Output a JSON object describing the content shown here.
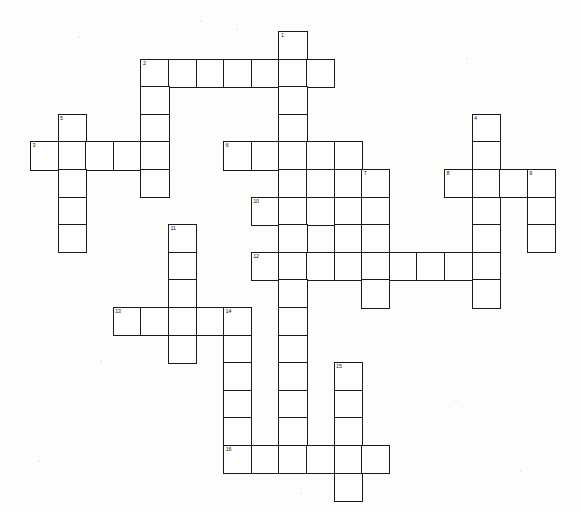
{
  "document": {
    "type": "crossword-puzzle-grid",
    "title": "Crossword Puzzle",
    "background_color": "#fdfdfc",
    "cell_fill_color": "#ffffff",
    "cell_border_color": "#1a1a1a",
    "number_color": "#151515",
    "cell_size_px": 27.6,
    "origin": {
      "x": 30,
      "y": 31
    },
    "grid_columns": 19,
    "grid_rows": 17
  },
  "chart_data": {
    "type": "table",
    "clue_numbers": [
      1,
      2,
      3,
      4,
      5,
      6,
      7,
      8,
      9,
      10,
      11,
      12,
      13,
      14,
      15,
      16
    ],
    "entries": [
      {
        "number": 1,
        "direction": "down",
        "col": 9,
        "row": 0,
        "length": 5
      },
      {
        "number": 2,
        "direction": "across",
        "col": 4,
        "row": 1,
        "length": 7
      },
      {
        "number": 3,
        "direction": "across",
        "col": 0,
        "row": 4,
        "length": 5
      },
      {
        "number": 4,
        "direction": "down",
        "col": 16,
        "row": 3,
        "length": 7
      },
      {
        "number": 5,
        "direction": "down",
        "col": 1,
        "row": 3,
        "length": 6
      },
      {
        "number": 6,
        "direction": "across",
        "col": 7,
        "row": 4,
        "length": 5
      },
      {
        "number": 7,
        "direction": "down",
        "col": 12,
        "row": 5,
        "length": 5
      },
      {
        "number": 8,
        "direction": "across",
        "col": 15,
        "row": 5,
        "length": 4
      },
      {
        "number": 9,
        "direction": "down",
        "col": 18,
        "row": 5,
        "length": 4
      },
      {
        "number": 10,
        "direction": "across",
        "col": 8,
        "row": 6,
        "length": 5
      },
      {
        "number": 11,
        "direction": "down",
        "col": 5,
        "row": 7,
        "length": 5
      },
      {
        "number": 12,
        "direction": "across",
        "col": 8,
        "row": 8,
        "length": 9
      },
      {
        "number": 13,
        "direction": "across",
        "col": 3,
        "row": 10,
        "length": 5
      },
      {
        "number": 14,
        "direction": "down",
        "col": 7,
        "row": 10,
        "length": 6
      },
      {
        "number": 15,
        "direction": "down",
        "col": 11,
        "row": 12,
        "length": 5
      },
      {
        "number": 16,
        "direction": "across",
        "col": 7,
        "row": 15,
        "length": 6
      }
    ],
    "down_columns": [
      {
        "label": "1",
        "col": 9,
        "row_start": 0,
        "row_end": 4
      },
      {
        "label": "2",
        "col": 4,
        "row_start": 1,
        "row_end": 5
      },
      {
        "label": "4",
        "col": 16,
        "row_start": 3,
        "row_end": 9
      },
      {
        "label": "5",
        "col": 1,
        "row_start": 3,
        "row_end": 8
      },
      {
        "label": "7",
        "col": 12,
        "row_start": 5,
        "row_end": 9
      },
      {
        "label": "9",
        "col": 18,
        "row_start": 5,
        "row_end": 8
      },
      {
        "label": "11",
        "col": 5,
        "row_start": 7,
        "row_end": 11
      },
      {
        "label": "14",
        "col": 7,
        "row_start": 10,
        "row_end": 15
      },
      {
        "label": "15",
        "col": 11,
        "row_start": 12,
        "row_end": 16
      },
      {
        "label": "center",
        "col": 9,
        "row_start": 4,
        "row_end": 15
      }
    ],
    "cells": [
      {
        "col": 9,
        "row": 0,
        "num": "1"
      },
      {
        "col": 4,
        "row": 1,
        "num": "2"
      },
      {
        "col": 5,
        "row": 1,
        "num": ""
      },
      {
        "col": 6,
        "row": 1,
        "num": ""
      },
      {
        "col": 7,
        "row": 1,
        "num": ""
      },
      {
        "col": 8,
        "row": 1,
        "num": ""
      },
      {
        "col": 9,
        "row": 1,
        "num": ""
      },
      {
        "col": 10,
        "row": 1,
        "num": ""
      },
      {
        "col": 4,
        "row": 2,
        "num": ""
      },
      {
        "col": 9,
        "row": 2,
        "num": ""
      },
      {
        "col": 1,
        "row": 3,
        "num": "5"
      },
      {
        "col": 4,
        "row": 3,
        "num": ""
      },
      {
        "col": 9,
        "row": 3,
        "num": ""
      },
      {
        "col": 16,
        "row": 3,
        "num": "4"
      },
      {
        "col": 0,
        "row": 4,
        "num": "3"
      },
      {
        "col": 1,
        "row": 4,
        "num": ""
      },
      {
        "col": 2,
        "row": 4,
        "num": ""
      },
      {
        "col": 3,
        "row": 4,
        "num": ""
      },
      {
        "col": 4,
        "row": 4,
        "num": ""
      },
      {
        "col": 7,
        "row": 4,
        "num": "6"
      },
      {
        "col": 8,
        "row": 4,
        "num": ""
      },
      {
        "col": 9,
        "row": 4,
        "num": ""
      },
      {
        "col": 10,
        "row": 4,
        "num": ""
      },
      {
        "col": 11,
        "row": 4,
        "num": ""
      },
      {
        "col": 16,
        "row": 4,
        "num": ""
      },
      {
        "col": 1,
        "row": 5,
        "num": ""
      },
      {
        "col": 4,
        "row": 5,
        "num": ""
      },
      {
        "col": 9,
        "row": 5,
        "num": ""
      },
      {
        "col": 10,
        "row": 5,
        "num": ""
      },
      {
        "col": 11,
        "row": 5,
        "num": ""
      },
      {
        "col": 12,
        "row": 5,
        "num": "7"
      },
      {
        "col": 15,
        "row": 5,
        "num": "8"
      },
      {
        "col": 16,
        "row": 5,
        "num": ""
      },
      {
        "col": 17,
        "row": 5,
        "num": ""
      },
      {
        "col": 18,
        "row": 5,
        "num": "9"
      },
      {
        "col": 1,
        "row": 6,
        "num": ""
      },
      {
        "col": 8,
        "row": 6,
        "num": "10"
      },
      {
        "col": 9,
        "row": 6,
        "num": ""
      },
      {
        "col": 10,
        "row": 6,
        "num": ""
      },
      {
        "col": 11,
        "row": 6,
        "num": ""
      },
      {
        "col": 12,
        "row": 6,
        "num": ""
      },
      {
        "col": 16,
        "row": 6,
        "num": ""
      },
      {
        "col": 18,
        "row": 6,
        "num": ""
      },
      {
        "col": 1,
        "row": 7,
        "num": ""
      },
      {
        "col": 5,
        "row": 7,
        "num": "11"
      },
      {
        "col": 9,
        "row": 7,
        "num": ""
      },
      {
        "col": 11,
        "row": 7,
        "num": ""
      },
      {
        "col": 12,
        "row": 7,
        "num": ""
      },
      {
        "col": 16,
        "row": 7,
        "num": ""
      },
      {
        "col": 18,
        "row": 7,
        "num": ""
      },
      {
        "col": 5,
        "row": 8,
        "num": ""
      },
      {
        "col": 8,
        "row": 8,
        "num": "12"
      },
      {
        "col": 9,
        "row": 8,
        "num": ""
      },
      {
        "col": 10,
        "row": 8,
        "num": ""
      },
      {
        "col": 11,
        "row": 8,
        "num": ""
      },
      {
        "col": 12,
        "row": 8,
        "num": ""
      },
      {
        "col": 13,
        "row": 8,
        "num": ""
      },
      {
        "col": 14,
        "row": 8,
        "num": ""
      },
      {
        "col": 15,
        "row": 8,
        "num": ""
      },
      {
        "col": 16,
        "row": 8,
        "num": ""
      },
      {
        "col": 5,
        "row": 9,
        "num": ""
      },
      {
        "col": 9,
        "row": 9,
        "num": ""
      },
      {
        "col": 12,
        "row": 9,
        "num": ""
      },
      {
        "col": 16,
        "row": 9,
        "num": ""
      },
      {
        "col": 3,
        "row": 10,
        "num": "13"
      },
      {
        "col": 4,
        "row": 10,
        "num": ""
      },
      {
        "col": 5,
        "row": 10,
        "num": ""
      },
      {
        "col": 6,
        "row": 10,
        "num": ""
      },
      {
        "col": 7,
        "row": 10,
        "num": "14"
      },
      {
        "col": 9,
        "row": 10,
        "num": ""
      },
      {
        "col": 5,
        "row": 11,
        "num": ""
      },
      {
        "col": 7,
        "row": 11,
        "num": ""
      },
      {
        "col": 9,
        "row": 11,
        "num": ""
      },
      {
        "col": 7,
        "row": 12,
        "num": ""
      },
      {
        "col": 9,
        "row": 12,
        "num": ""
      },
      {
        "col": 11,
        "row": 12,
        "num": "15"
      },
      {
        "col": 7,
        "row": 13,
        "num": ""
      },
      {
        "col": 9,
        "row": 13,
        "num": ""
      },
      {
        "col": 11,
        "row": 13,
        "num": ""
      },
      {
        "col": 7,
        "row": 14,
        "num": ""
      },
      {
        "col": 9,
        "row": 14,
        "num": ""
      },
      {
        "col": 11,
        "row": 14,
        "num": ""
      },
      {
        "col": 7,
        "row": 15,
        "num": "16"
      },
      {
        "col": 8,
        "row": 15,
        "num": ""
      },
      {
        "col": 9,
        "row": 15,
        "num": ""
      },
      {
        "col": 10,
        "row": 15,
        "num": ""
      },
      {
        "col": 11,
        "row": 15,
        "num": ""
      },
      {
        "col": 12,
        "row": 15,
        "num": ""
      },
      {
        "col": 11,
        "row": 16,
        "num": ""
      }
    ],
    "specks": [
      {
        "x": 78,
        "y": 36,
        "d": 2
      },
      {
        "x": 236,
        "y": 28,
        "d": 2
      },
      {
        "x": 466,
        "y": 58,
        "d": 2
      },
      {
        "x": 74,
        "y": 152,
        "d": 2
      },
      {
        "x": 150,
        "y": 152,
        "d": 2
      },
      {
        "x": 540,
        "y": 200,
        "d": 2
      },
      {
        "x": 100,
        "y": 360,
        "d": 2
      },
      {
        "x": 455,
        "y": 400,
        "d": 2
      },
      {
        "x": 38,
        "y": 460,
        "d": 2
      },
      {
        "x": 520,
        "y": 470,
        "d": 2
      },
      {
        "x": 300,
        "y": 492,
        "d": 2
      },
      {
        "x": 200,
        "y": 20,
        "d": 2
      }
    ]
  }
}
